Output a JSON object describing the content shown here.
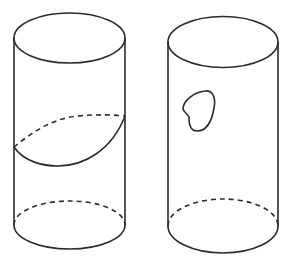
{
  "figure": {
    "stroke_color": "#2b2b2b",
    "background": "#ffffff",
    "cylinders": [
      {
        "id": "left",
        "label": "",
        "feature": "slanted closed curve wrapping around the cylinder (front solid, back dashed)"
      },
      {
        "id": "right",
        "label": "",
        "feature": "small closed blob-shaped curve on the front surface"
      }
    ]
  }
}
